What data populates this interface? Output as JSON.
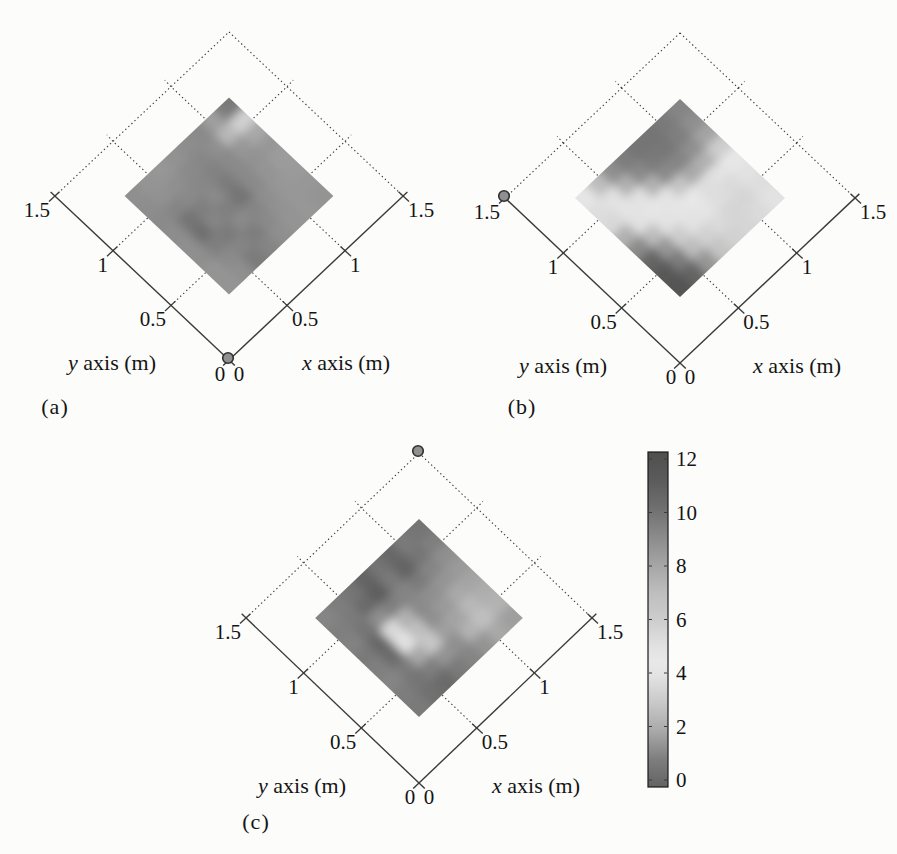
{
  "figure": {
    "background": "#fcfcfa",
    "subplots": [
      {
        "caption": "(a)",
        "y_axis": {
          "title_var": "y",
          "title_rest": " axis (m)",
          "ticks": [
            "0",
            "0.5",
            "1",
            "1.5"
          ]
        },
        "x_axis": {
          "title_var": "x",
          "title_rest": " axis (m)",
          "ticks": [
            "0",
            "0.5",
            "1",
            "1.5"
          ]
        },
        "marker": "gray dot at origin (0, 0)"
      },
      {
        "caption": "(b)",
        "y_axis": {
          "title_var": "y",
          "title_rest": " axis (m)",
          "ticks": [
            "0",
            "0.5",
            "1",
            "1.5"
          ]
        },
        "x_axis": {
          "title_var": "x",
          "title_rest": " axis (m)",
          "ticks": [
            "0",
            "0.5",
            "1",
            "1.5"
          ]
        },
        "marker": "gray dot at (0, 1.5)"
      },
      {
        "caption": "(c)",
        "y_axis": {
          "title_var": "y",
          "title_rest": " axis (m)",
          "ticks": [
            "0",
            "0.5",
            "1",
            "1.5"
          ]
        },
        "x_axis": {
          "title_var": "x",
          "title_rest": " axis (m)",
          "ticks": [
            "0",
            "0.5",
            "1",
            "1.5"
          ]
        },
        "marker": "gray dot at (1.5, 1.5)"
      }
    ],
    "colorbar": {
      "ticks": [
        "0",
        "2",
        "4",
        "6",
        "8",
        "10",
        "12"
      ]
    },
    "colors": {
      "axis_line": "#3a3a3a",
      "grid_dotted": "#3c3c3c",
      "text": "#141414",
      "marker_fill": "#909090",
      "marker_stroke": "#2f2f2f",
      "colorbar_border": "#1a1a1a"
    }
  },
  "chart_data": {
    "type": "heatmap",
    "value_range": [
      0,
      12
    ],
    "colorbar_ticks": [
      0,
      2,
      4,
      6,
      8,
      10,
      12
    ],
    "colormap_grayscale_stops": [
      [
        0,
        "#636363"
      ],
      [
        1,
        "#7e7e7e"
      ],
      [
        2,
        "#a9a9a9"
      ],
      [
        3,
        "#c8c8c8"
      ],
      [
        4,
        "#e3e3e3"
      ],
      [
        4.5,
        "#e8e8e8"
      ],
      [
        5,
        "#e2e2e2"
      ],
      [
        6,
        "#cdcdcd"
      ],
      [
        7,
        "#bdbdbd"
      ],
      [
        8,
        "#a4a4a4"
      ],
      [
        9,
        "#8a8a8a"
      ],
      [
        10,
        "#6f6f6f"
      ],
      [
        11,
        "#5b5b5b"
      ],
      [
        12,
        "#4f4f4f"
      ]
    ],
    "panels": [
      {
        "label": "(a)",
        "xlabel": "x axis (m)",
        "ylabel": "y axis (m)",
        "axis_range_m": [
          0,
          1.5
        ],
        "axis_ticks_m": [
          0,
          0.5,
          1,
          1.5
        ],
        "heat_extent_m": [
          0.3,
          1.2
        ],
        "marker_m": [
          0,
          0
        ],
        "grid_rows_ymax_to_ymin_cols_xmin_to_xmax": [
          [
            8.8,
            8.6,
            8.5,
            8.7,
            8.9,
            9.0,
            8.2,
            9.6
          ],
          [
            8.9,
            8.7,
            8.8,
            9.0,
            9.1,
            8.8,
            7.2,
            5.8
          ],
          [
            9.0,
            9.2,
            9.0,
            9.1,
            9.3,
            9.0,
            8.5,
            7.9
          ],
          [
            8.9,
            9.8,
            9.4,
            9.0,
            9.6,
            9.0,
            8.7,
            8.5
          ],
          [
            8.8,
            10.0,
            9.2,
            9.4,
            9.8,
            9.0,
            8.6,
            8.3
          ],
          [
            8.8,
            9.4,
            9.6,
            9.0,
            9.2,
            8.8,
            8.5,
            8.4
          ],
          [
            8.6,
            9.0,
            9.2,
            9.5,
            9.0,
            8.7,
            8.5,
            8.5
          ],
          [
            8.6,
            8.8,
            9.6,
            9.2,
            8.8,
            8.6,
            8.5,
            8.6
          ]
        ]
      },
      {
        "label": "(b)",
        "xlabel": "x axis (m)",
        "ylabel": "y axis (m)",
        "axis_range_m": [
          0,
          1.5
        ],
        "axis_ticks_m": [
          0,
          0.5,
          1,
          1.5
        ],
        "heat_extent_m": [
          0.3,
          1.2
        ],
        "marker_m": [
          0,
          1.5
        ],
        "grid_rows_ymax_to_ymin_cols_xmin_to_xmax": [
          [
            4.2,
            7.0,
            8.8,
            9.5,
            9.8,
            9.8,
            9.6,
            9.2
          ],
          [
            3.8,
            5.0,
            7.5,
            9.0,
            9.6,
            9.7,
            9.4,
            8.8
          ],
          [
            5.5,
            4.0,
            5.0,
            7.5,
            9.0,
            9.2,
            8.8,
            8.0
          ],
          [
            7.5,
            5.0,
            4.2,
            4.8,
            6.5,
            7.8,
            7.5,
            6.0
          ],
          [
            9.0,
            7.0,
            5.0,
            4.2,
            4.4,
            5.2,
            5.0,
            4.6
          ],
          [
            10.5,
            8.5,
            6.0,
            5.0,
            4.8,
            5.2,
            5.4,
            5.0
          ],
          [
            11.2,
            9.5,
            7.0,
            5.8,
            5.4,
            5.6,
            5.6,
            5.2
          ],
          [
            11.5,
            10.5,
            8.5,
            6.5,
            5.8,
            5.6,
            5.4,
            5.0
          ]
        ]
      },
      {
        "label": "(c)",
        "xlabel": "x axis (m)",
        "ylabel": "y axis (m)",
        "axis_range_m": [
          0,
          1.5
        ],
        "axis_ticks_m": [
          0,
          0.5,
          1,
          1.5
        ],
        "heat_extent_m": [
          0.3,
          1.2
        ],
        "marker_m": [
          1.5,
          1.5
        ],
        "grid_rows_ymax_to_ymin_cols_xmin_to_xmax": [
          [
            9.2,
            9.5,
            9.8,
            10.6,
            9.8,
            10.4,
            9.6,
            9.8
          ],
          [
            9.4,
            9.6,
            10.2,
            10.8,
            9.6,
            10.6,
            9.8,
            9.4
          ],
          [
            9.3,
            9.8,
            8.8,
            9.4,
            9.2,
            9.6,
            9.2,
            8.8
          ],
          [
            9.6,
            10.4,
            5.4,
            7.5,
            9.0,
            8.8,
            8.6,
            8.4
          ],
          [
            9.4,
            10.2,
            5.0,
            6.8,
            8.8,
            8.4,
            7.8,
            8.0
          ],
          [
            9.2,
            9.6,
            7.8,
            6.4,
            8.2,
            8.0,
            7.2,
            7.6
          ],
          [
            9.5,
            9.8,
            9.4,
            8.6,
            8.8,
            7.4,
            6.8,
            7.4
          ],
          [
            9.6,
            10.0,
            10.2,
            9.6,
            9.2,
            8.6,
            7.8,
            8.2
          ]
        ]
      }
    ]
  }
}
